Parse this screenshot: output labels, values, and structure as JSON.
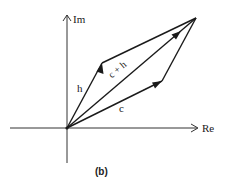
{
  "diagram": {
    "type": "vector-addition-complex-plane",
    "caption": "(b)",
    "axes": {
      "real_label": "Re",
      "imag_label": "Im"
    },
    "vectors": [
      {
        "name": "h",
        "label": "h"
      },
      {
        "name": "c",
        "label": "c"
      },
      {
        "name": "sum",
        "label": "c + h"
      }
    ],
    "colors": {
      "line": "#1a1a1a",
      "background": "#ffffff"
    }
  }
}
